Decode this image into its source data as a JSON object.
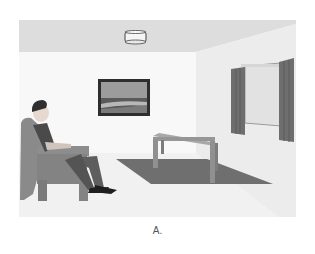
{
  "figure": {
    "caption": "A.",
    "colors": {
      "ceiling": "#dcdcdc",
      "back_wall": "#f7f7f7",
      "right_wall": "#ededed",
      "floor": "#f1f1f1",
      "armchair": "#8a8a8a",
      "rug": "#707070",
      "table": "#9a9a9a",
      "curtain": "#6e6e6e",
      "frame": "#2e2e2e",
      "window_glass": "#e3e3e3"
    }
  }
}
